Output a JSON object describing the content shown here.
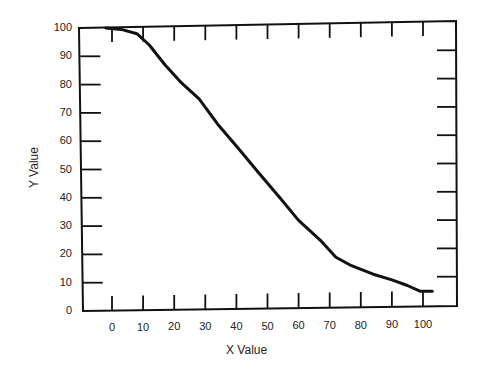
{
  "chart_data": {
    "type": "line",
    "title": "",
    "xlabel": "X Value",
    "ylabel": "Y Value",
    "xlim": [
      -3,
      107
    ],
    "ylim": [
      0,
      100
    ],
    "grid": false,
    "legend": null,
    "x_ticks": [
      0,
      10,
      20,
      30,
      40,
      50,
      60,
      70,
      80,
      90,
      100
    ],
    "y_ticks": [
      0,
      10,
      20,
      30,
      40,
      50,
      60,
      70,
      80,
      90,
      100
    ],
    "series": [
      {
        "name": "curve",
        "color": "#111111",
        "x": [
          -2,
          3,
          8,
          12,
          17,
          22,
          28,
          34,
          41,
          47,
          54,
          60,
          67,
          72,
          77,
          84,
          90,
          95,
          99,
          103
        ],
        "y": [
          100,
          99.5,
          98,
          94,
          87,
          81,
          75,
          66,
          57,
          49,
          40,
          32,
          25,
          19,
          16,
          13,
          11,
          9,
          7,
          7
        ]
      }
    ]
  },
  "labels": {
    "x_axis_title": "X Value",
    "y_axis_title": "Y Value",
    "y_ticks": [
      "0",
      "10",
      "20",
      "30",
      "40",
      "50",
      "60",
      "70",
      "80",
      "90",
      "100"
    ],
    "x_ticks": [
      "0",
      "10",
      "20",
      "30",
      "40",
      "50",
      "60",
      "70",
      "80",
      "90",
      "100"
    ]
  }
}
